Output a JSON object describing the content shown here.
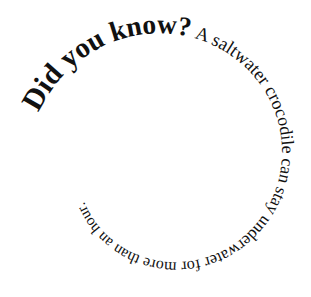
{
  "graphic": {
    "type": "spiral-text",
    "background": "#ffffff",
    "text_color": "#111111",
    "segments": [
      {
        "text": "Did you know?",
        "weight": "bold",
        "size_start": 30,
        "size_end": 27
      },
      {
        "text": " A saltwater crocodile can stay underwater for more than an hour.",
        "weight": "normal",
        "size_start": 19,
        "size_end": 15
      }
    ],
    "full_text": "Did you know? A saltwater crocodile can stay underwater for more than an hour.",
    "spiral": {
      "center_x": 168,
      "center_y": 160,
      "start_angle_deg": 200,
      "start_radius": 138,
      "end_radius": 38,
      "turns": 2.15,
      "direction": "clockwise"
    }
  }
}
